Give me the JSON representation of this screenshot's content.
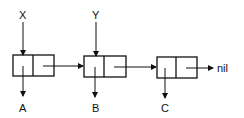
{
  "diagram": {
    "type": "linked-list",
    "pointers": [
      {
        "label": "X",
        "target": "cell-1"
      },
      {
        "label": "Y",
        "target": "cell-2"
      }
    ],
    "cells": [
      {
        "id": "cell-1",
        "car": "A",
        "cdr": "cell-2"
      },
      {
        "id": "cell-2",
        "car": "B",
        "cdr": "cell-3"
      },
      {
        "id": "cell-3",
        "car": "C",
        "cdr": "nil"
      }
    ],
    "labels": {
      "x": "X",
      "y": "Y",
      "a": "A",
      "b": "B",
      "c": "C",
      "nil": "nil"
    },
    "colors": {
      "stroke": "#111111",
      "background": "#ffffff"
    }
  }
}
